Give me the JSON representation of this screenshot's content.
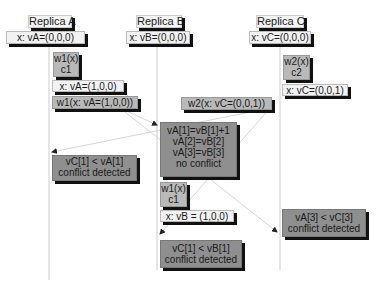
{
  "replicas": [
    {
      "name": "Replica A",
      "init": "x: vA=(0,0,0)"
    },
    {
      "name": "Replica B",
      "init": "x: vB=(0,0,0)"
    },
    {
      "name": "Replica C",
      "init": "x: vC=(0,0,0)"
    }
  ],
  "replica_a": {
    "write": [
      "w1(x)",
      "c1"
    ],
    "state": "x: vA=(1,0,0)",
    "message": "w1(x: vA=(1,0,0))",
    "conflict": [
      "vC[1] < vA[1]",
      "conflict detected"
    ]
  },
  "replica_b": {
    "check": [
      "vA[1]=vB[1]+1",
      "vA[2]=vB[2]",
      "vA[3]=vB[3]",
      "no conflict"
    ],
    "write": [
      "w1(x)",
      "c1"
    ],
    "state": "x: vB = (1,0,0)",
    "conflict": [
      "vC[1] < vB[1]",
      "conflict detected"
    ]
  },
  "replica_c": {
    "write": [
      "w2(x)",
      "c2"
    ],
    "state": "x: vC=(0,0,1)",
    "message": "w2(x: vC=(0,0,1))",
    "conflict": [
      "vA[3] < vC[3]",
      "conflict detected"
    ]
  }
}
